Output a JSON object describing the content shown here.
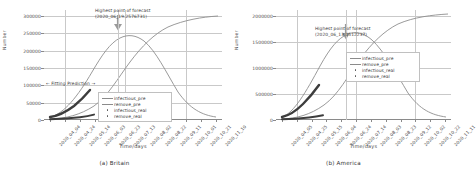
{
  "figure": {
    "panels": [
      {
        "caption": "(a) Britain",
        "xlabel": "Time/days",
        "ylabel": "Number",
        "peak_annotation_line1": "Highest point of forecast",
        "peak_annotation_line2": "(2020_06_19.2576731)",
        "fit_annotation": "← Fitting Prediction →",
        "yticks": [
          "0",
          "50000",
          "100000",
          "150000",
          "200000",
          "250000",
          "300000"
        ],
        "xticks": [
          "2020_04_04",
          "2020_04_24",
          "2020_05_14",
          "2020_06_03",
          "2020_06_23",
          "2020_07_13",
          "2020_08_02",
          "2020_08_22",
          "2020_09_11",
          "2020_10_01",
          "2020_10_21",
          "2020_11_10"
        ],
        "legend": [
          {
            "label": "infectious_pre",
            "type": "line",
            "color": "#8b8b8b"
          },
          {
            "label": "remove_pre",
            "type": "line",
            "color": "#8b8b8b"
          },
          {
            "label": "infectious_real",
            "type": "dot",
            "color": "#555555"
          },
          {
            "label": "remove_real",
            "type": "dot",
            "color": "#555555"
          }
        ]
      },
      {
        "caption": "(b) America",
        "xlabel": "Time/days",
        "ylabel": "Number",
        "peak_annotation_line1": "Highest point of forecast",
        "peak_annotation_line2": "(2020_06_13.1512237)",
        "fit_annotation": "",
        "yticks": [
          "0",
          "500000",
          "1000000",
          "1500000",
          "2000000"
        ],
        "xticks": [
          "2020_04_05",
          "2020_04_25",
          "2020_05_15",
          "2020_06_04",
          "2020_06_24",
          "2020_07_14",
          "2020_08_03",
          "2020_08_23",
          "2020_09_12",
          "2020_10_02",
          "2020_10_22",
          "2020_11_11"
        ],
        "legend": [
          {
            "label": "infectious_pre",
            "type": "line",
            "color": "#8b8b8b"
          },
          {
            "label": "remove_pre",
            "type": "line",
            "color": "#8b8b8b"
          },
          {
            "label": "infectious_real",
            "type": "dot",
            "color": "#555555"
          },
          {
            "label": "remove_real",
            "type": "dot",
            "color": "#555555"
          }
        ]
      }
    ]
  },
  "chart_data": [
    {
      "type": "line",
      "title": "(a) Britain",
      "xlabel": "Time/days",
      "ylabel": "Number",
      "ylim": [
        0,
        320000
      ],
      "grid": true,
      "legend_position": "lower-center",
      "annotations": [
        {
          "text": "Highest point of forecast (2020_06_19.2576731)",
          "x": "2020_06_19",
          "y": 257673
        },
        {
          "text": "← Fitting Prediction →",
          "x": "2020_04_24",
          "y": 120000
        }
      ],
      "x": [
        "2020_04_04",
        "2020_04_24",
        "2020_05_14",
        "2020_06_03",
        "2020_06_23",
        "2020_07_13",
        "2020_08_02",
        "2020_08_22",
        "2020_09_11",
        "2020_10_01",
        "2020_10_21",
        "2020_11_10"
      ],
      "series": [
        {
          "name": "infectious_pre",
          "values": [
            8000,
            60000,
            160000,
            236000,
            257000,
            236000,
            182000,
            122000,
            72000,
            40000,
            21000,
            10000
          ]
        },
        {
          "name": "remove_pre",
          "values": [
            1500,
            9000,
            36000,
            96000,
            178000,
            250000,
            295000,
            318000,
            327000,
            331000,
            333000,
            334000
          ]
        },
        {
          "name": "infectious_real",
          "values": [
            8000,
            58000,
            95000,
            null,
            null,
            null,
            null,
            null,
            null,
            null,
            null,
            null
          ]
        },
        {
          "name": "remove_real",
          "values": [
            1200,
            7000,
            20000,
            null,
            null,
            null,
            null,
            null,
            null,
            null,
            null,
            null
          ]
        }
      ]
    },
    {
      "type": "line",
      "title": "(b) America",
      "xlabel": "Time/days",
      "ylabel": "Number",
      "ylim": [
        0,
        2200000
      ],
      "grid": true,
      "legend_position": "upper-right",
      "annotations": [
        {
          "text": "Highest point of forecast (2020_06_13.1512237)",
          "x": "2020_06_13",
          "y": 1512237
        }
      ],
      "x": [
        "2020_04_05",
        "2020_04_25",
        "2020_05_15",
        "2020_06_04",
        "2020_06_24",
        "2020_07_14",
        "2020_08_03",
        "2020_08_23",
        "2020_09_12",
        "2020_10_02",
        "2020_10_22",
        "2020_11_11"
      ],
      "series": [
        {
          "name": "infectious_pre",
          "values": [
            60000,
            420000,
            1050000,
            1450000,
            1490000,
            1290000,
            950000,
            620000,
            370000,
            205000,
            110000,
            58000
          ]
        },
        {
          "name": "remove_pre",
          "values": [
            9000,
            70000,
            270000,
            680000,
            1180000,
            1620000,
            1900000,
            2050000,
            2120000,
            2155000,
            2170000,
            2180000
          ]
        },
        {
          "name": "infectious_real",
          "values": [
            60000,
            400000,
            700000,
            null,
            null,
            null,
            null,
            null,
            null,
            null,
            null,
            null
          ]
        },
        {
          "name": "remove_real",
          "values": [
            8000,
            50000,
            130000,
            null,
            null,
            null,
            null,
            null,
            null,
            null,
            null,
            null
          ]
        }
      ]
    }
  ]
}
